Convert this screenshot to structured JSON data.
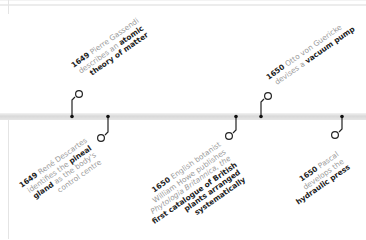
{
  "timeline": {
    "events": [
      {
        "year": "1649",
        "side": "above",
        "lines": [
          {
            "plain": " Pierre Gassendi",
            "bold": ""
          },
          {
            "plain": "describes an ",
            "bold": "atomic"
          },
          {
            "plain": "",
            "bold": "theory of matter"
          }
        ]
      },
      {
        "year": "1649",
        "side": "below",
        "lines": [
          {
            "plain": " René Descartes",
            "bold": ""
          },
          {
            "plain": "identifies the ",
            "bold": "pineal"
          },
          {
            "bold": "gland",
            "plain": " as the body's"
          },
          {
            "plain": "control centre",
            "bold": ""
          }
        ]
      },
      {
        "year": "1650",
        "side": "below",
        "lines": [
          {
            "plain": " English botanist",
            "bold": ""
          },
          {
            "plain": "William Howe publishes",
            "bold": ""
          },
          {
            "plain": "Phytologia Britannica, the",
            "bold": ""
          },
          {
            "plain": "",
            "bold": "first catalogue of British"
          },
          {
            "plain": "",
            "bold": "plants arranged"
          },
          {
            "plain": "",
            "bold": "systematically"
          }
        ]
      },
      {
        "year": "1650",
        "side": "above",
        "lines": [
          {
            "plain": " Otto von Guericke",
            "bold": ""
          },
          {
            "plain": "devises a ",
            "bold": "vacuum pump"
          }
        ]
      },
      {
        "year": "1650",
        "side": "below",
        "lines": [
          {
            "plain": " Pascal",
            "bold": ""
          },
          {
            "plain": "develops the",
            "bold": ""
          },
          {
            "plain": "",
            "bold": "hydraulic press"
          }
        ]
      }
    ],
    "colors": {
      "line": "#222222",
      "bar": "#dcdcdc",
      "text_plain": "#9a9a9a",
      "text_bold": "#222222"
    }
  }
}
